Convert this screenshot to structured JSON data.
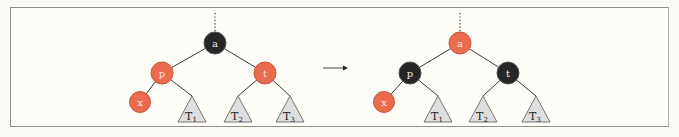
{
  "diagram": {
    "type": "red-black tree recoloring",
    "colors": {
      "red": "#ea6b4e",
      "black": "#262626",
      "subtree_fill": "#dedede",
      "edge": "#3a3a3a",
      "background": "#fdfcf6",
      "border": "#8f8f8a"
    },
    "arrow_label": "→",
    "before": {
      "nodes": [
        {
          "id": "a",
          "label": "a",
          "color": "black"
        },
        {
          "id": "p",
          "label": "p",
          "color": "red"
        },
        {
          "id": "t",
          "label": "t",
          "color": "red"
        },
        {
          "id": "x",
          "label": "x",
          "color": "red"
        }
      ],
      "subtrees": [
        {
          "label": "T",
          "sub": "1"
        },
        {
          "label": "T",
          "sub": "2"
        },
        {
          "label": "T",
          "sub": "3"
        }
      ]
    },
    "after": {
      "nodes": [
        {
          "id": "a",
          "label": "a",
          "color": "red"
        },
        {
          "id": "p",
          "label": "p",
          "color": "black"
        },
        {
          "id": "t",
          "label": "t",
          "color": "black"
        },
        {
          "id": "x",
          "label": "x",
          "color": "red"
        }
      ],
      "subtrees": [
        {
          "label": "T",
          "sub": "1"
        },
        {
          "label": "T",
          "sub": "2"
        },
        {
          "label": "T",
          "sub": "3"
        }
      ]
    }
  }
}
